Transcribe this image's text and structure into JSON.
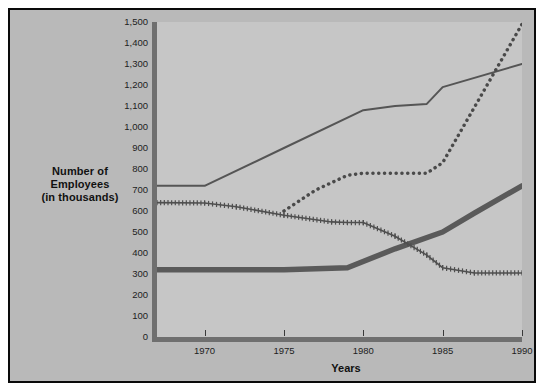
{
  "chart_data": {
    "type": "line",
    "title": "",
    "subtitle": "",
    "xlabel": "Years",
    "ylabel": "Number of Employees (in thousands)",
    "ylabel_lines": [
      "Number of",
      "Employees",
      "(in thousands)"
    ],
    "xlim": [
      1967,
      1990
    ],
    "ylim": [
      0,
      1500
    ],
    "yticks": [
      0,
      100,
      200,
      300,
      400,
      500,
      600,
      700,
      800,
      900,
      1000,
      1100,
      1200,
      1300,
      1400,
      1500
    ],
    "ytick_labels": [
      "0",
      "100",
      "200",
      "300",
      "400",
      "500",
      "600",
      "700",
      "800",
      "900",
      "1,000",
      "1,100",
      "1,200",
      "1,300",
      "1,400",
      "1,500"
    ],
    "xticks": [
      1970,
      1975,
      1980,
      1985,
      1990
    ],
    "xtick_labels": [
      "1970",
      "1975",
      "1980",
      "1985",
      "1990"
    ],
    "grid": false,
    "legend": "none",
    "series": [
      {
        "name": "thin-solid-series",
        "style": "solid-thin",
        "color": "#555555",
        "x": [
          1967,
          1970,
          1975,
          1980,
          1982,
          1984,
          1985,
          1990
        ],
        "values": [
          720,
          720,
          900,
          1080,
          1100,
          1110,
          1190,
          1300
        ]
      },
      {
        "name": "dotted-series",
        "style": "dotted",
        "color": "#4a4a4a",
        "x": [
          1975,
          1977,
          1979,
          1980,
          1984,
          1985,
          1990
        ],
        "values": [
          600,
          700,
          770,
          780,
          780,
          830,
          1490
        ]
      },
      {
        "name": "thick-solid-series",
        "style": "solid-thick",
        "color": "#5a5a5a",
        "x": [
          1967,
          1975,
          1979,
          1982,
          1985,
          1987,
          1990
        ],
        "values": [
          320,
          320,
          330,
          420,
          500,
          590,
          720
        ]
      },
      {
        "name": "plus-marker-series",
        "style": "plus-hatched",
        "color": "#4f4f4f",
        "x": [
          1967,
          1970,
          1972,
          1975,
          1978,
          1979,
          1980,
          1982,
          1984,
          1985,
          1987,
          1990
        ],
        "values": [
          640,
          638,
          620,
          580,
          548,
          545,
          545,
          480,
          390,
          330,
          305,
          305
        ]
      }
    ]
  }
}
